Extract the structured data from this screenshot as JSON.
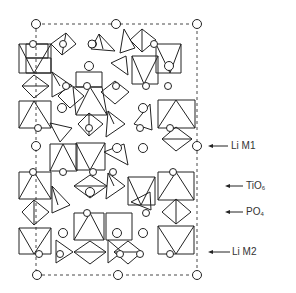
{
  "diagram": {
    "title": "",
    "type": "crystal-structure-projection",
    "labels": [
      {
        "id": "li-m1",
        "text": "Li M1",
        "x": 230,
        "y": 141,
        "arrow_from": 228,
        "arrow_to": 210,
        "arrow_y": 146
      },
      {
        "id": "tio6",
        "main": "TiO",
        "sub": "6",
        "x": 246,
        "y": 181,
        "arrow_from": 243,
        "arrow_to": 226,
        "arrow_y": 186
      },
      {
        "id": "po4",
        "main": "PO",
        "sub": "4",
        "x": 246,
        "y": 207,
        "arrow_from": 243,
        "arrow_to": 226,
        "arrow_y": 212
      },
      {
        "id": "li-m2",
        "text": "Li M2",
        "x": 232,
        "y": 247,
        "arrow_from": 230,
        "arrow_to": 210,
        "arrow_y": 252
      }
    ],
    "unit_cell": {
      "x1": 36,
      "y1": 24,
      "x2": 197,
      "y2": 275
    },
    "legend": {
      "li_m1": "Li M1",
      "tio6": "TiO6",
      "po4": "PO4",
      "li_m2": "Li M2"
    }
  }
}
